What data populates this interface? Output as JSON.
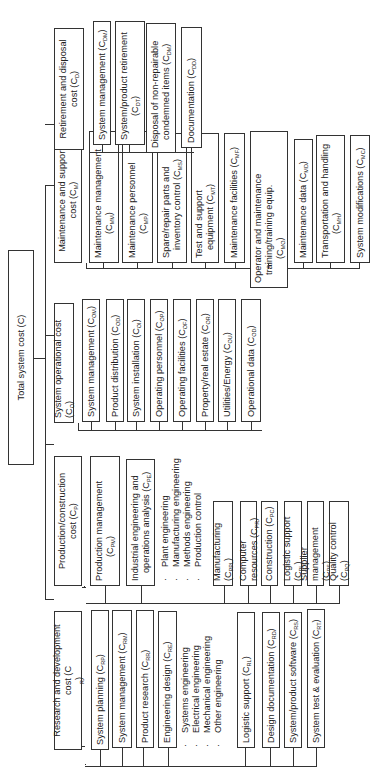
{
  "diagram": {
    "orientation": "rotated -90 degrees",
    "root": {
      "label": "Total system cost (C)"
    },
    "categories": [
      {
        "id": "rd",
        "label_line1": "Research and development",
        "label_line2": "cost (C",
        "label_sub": "R",
        "label_tail": ")",
        "children": [
          {
            "text": "System planning (C",
            "sub": "RP",
            "tail": ")"
          },
          {
            "text": "System management (C",
            "sub": "RM",
            "tail": ")"
          },
          {
            "text": "Product research (C",
            "sub": "RR",
            "tail": ")"
          },
          {
            "text": "Engineering design (C",
            "sub": "RE",
            "tail": ")"
          },
          {
            "text": "Logistic support (C",
            "sub": "RL",
            "tail": ")"
          },
          {
            "text": "Design documentation (C",
            "sub": "RD",
            "tail": ")"
          },
          {
            "text": "System/product software (C",
            "sub": "RS",
            "tail": ")"
          },
          {
            "text": "System test & evaluation (C",
            "sub": "RT",
            "tail": ")"
          }
        ],
        "engineering_list": [
          "Systems engineering",
          "Electrical engineering",
          "Mechanical engineering",
          "Other engineering"
        ]
      },
      {
        "id": "production",
        "label_line1": "Production/construction",
        "label_line2": "cost (C",
        "label_sub": "P",
        "label_tail": ")",
        "children": [
          {
            "line1": "Production management",
            "text": "(C",
            "sub": "PM",
            "tail": ")"
          },
          {
            "line1": "Industrial engineering and",
            "text": "operations analysis (C",
            "sub": "PE",
            "tail": ")"
          },
          {
            "text": "Manufacturing (C",
            "sub": "PPL",
            "tail": ")"
          },
          {
            "text": "Computer resources (C",
            "sub": "PR",
            "tail": ")"
          },
          {
            "text": "Construction (C",
            "sub": "PC",
            "tail": ")"
          },
          {
            "text": "Logistic support (C",
            "sub": "PL",
            "tail": ")"
          },
          {
            "text": "Supplier management (C",
            "sub": "PS",
            "tail": ")"
          },
          {
            "text": "Quality control (C",
            "sub": "PQ",
            "tail": ")"
          }
        ],
        "engineering_list": [
          "Plant engineering",
          "Manufacturing engineering",
          "Methods engineering",
          "Production control"
        ]
      },
      {
        "id": "operational",
        "label_line1": "System operational cost (C",
        "label_sub": "O",
        "label_tail": ")",
        "children": [
          {
            "text": "System management (C",
            "sub": "OM",
            "tail": ")"
          },
          {
            "text": "Product distribution (C",
            "sub": "OD",
            "tail": ")"
          },
          {
            "text": "System installation (C",
            "sub": "OI",
            "tail": ")"
          },
          {
            "text": "Operating personnel (C",
            "sub": "OP",
            "tail": ")"
          },
          {
            "text": "Operating facilities (C",
            "sub": "OF",
            "tail": ")"
          },
          {
            "text": "Property/real estate (C",
            "sub": "OR",
            "tail": ")"
          },
          {
            "text": "Utilities/Energy (C",
            "sub": "OU",
            "tail": ")"
          },
          {
            "text": "Operational data (C",
            "sub": "OD",
            "tail": ")"
          }
        ]
      },
      {
        "id": "maintenance",
        "label_line1": "Maintenance and support",
        "label_line2": "cost (C",
        "label_sub": "M",
        "label_tail": ")",
        "children": [
          {
            "line1": "Maintenance management",
            "text": "(C",
            "sub": "MM",
            "tail": ")"
          },
          {
            "line1": "Maintenance personnel",
            "text": "(C",
            "sub": "MP",
            "tail": ")"
          },
          {
            "line1": "Spare/repair parts and",
            "text": "inventory control (C",
            "sub": "MS",
            "tail": ")"
          },
          {
            "line1": "Test and support",
            "text": "equipment (C",
            "sub": "MT",
            "tail": ")"
          },
          {
            "text": "Maintenance facilities (C",
            "sub": "MF",
            "tail": ")"
          },
          {
            "line1": "Operator and maintenance",
            "line2": "training/training equip.",
            "text": "(C",
            "sub": "MO",
            "tail": ")"
          },
          {
            "text": "Maintenance data (C",
            "sub": "MD",
            "tail": ")"
          },
          {
            "line1": "Transportation and handling",
            "text": "(C",
            "sub": "MH",
            "tail": ")"
          },
          {
            "text": "System modifications (C",
            "sub": "MC",
            "tail": ")"
          }
        ]
      },
      {
        "id": "retirement",
        "label_line1": "Retirement and disposal",
        "label_line2": "cost (C",
        "label_sub": "D",
        "label_tail": ")",
        "children": [
          {
            "text": "System management (C",
            "sub": "DM",
            "tail": ")"
          },
          {
            "line1": "System/product retirement",
            "text": "(C",
            "sub": "DT",
            "tail": ")"
          },
          {
            "line1": "Disposal of non-repairable",
            "text": "condemned items (C",
            "sub": "DM",
            "tail": ")"
          },
          {
            "text": "Documentation (C",
            "sub": "DD",
            "tail": ")"
          }
        ]
      }
    ]
  }
}
